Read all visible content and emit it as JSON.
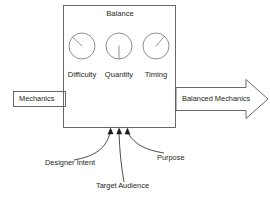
{
  "diagram": {
    "title": "Balance",
    "input": {
      "label": "Mechanics"
    },
    "output": {
      "label": "Balanced Mechanics"
    },
    "gauges": [
      {
        "label": "Difficulty",
        "needle_direction": "up-left"
      },
      {
        "label": "Quantity",
        "needle_direction": "down"
      },
      {
        "label": "Timing",
        "needle_direction": "up-right"
      }
    ],
    "influences": [
      {
        "label": "Designer Intent"
      },
      {
        "label": "Target Audience"
      },
      {
        "label": "Purpose"
      }
    ],
    "colors": {
      "background": "#ffffff",
      "line": "#59595b",
      "gauge_line": "#7b7b7d",
      "text": "#231f20",
      "arrowhead": "#1d1d1f"
    }
  }
}
